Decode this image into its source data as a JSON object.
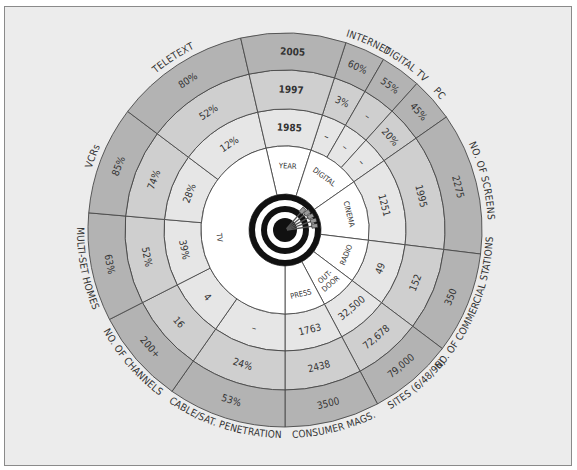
{
  "center": {
    "x": 285,
    "y": 230
  },
  "radii": {
    "bull": 36,
    "core": 84,
    "r1985": 121,
    "r1997": 160,
    "r2005": 197
  },
  "colors": {
    "background": "#ececec",
    "core": "#ffffff",
    "ring_1985": "#e6e6e6",
    "ring_1997": "#cfcfcf",
    "ring_2005": "#b3b3b3",
    "ink": "#333333",
    "bullseye": "#111111"
  },
  "year_header": {
    "label": "YEAR",
    "years": [
      "1985",
      "1997",
      "2005"
    ],
    "start": -13,
    "end": 18
  },
  "media": [
    {
      "name": "DIGITAL",
      "start": 18,
      "end": 55
    },
    {
      "name": "CINEMA",
      "start": 55,
      "end": 97
    },
    {
      "name": "RADIO",
      "start": 97,
      "end": 127
    },
    {
      "name": "OUT-DOOR",
      "start": 127,
      "end": 152
    },
    {
      "name": "PRESS",
      "start": 152,
      "end": 180
    },
    {
      "name": "TV",
      "start": 180,
      "end": 347
    }
  ],
  "segments": [
    {
      "id": "internet",
      "label": "INTERNET",
      "start": 18,
      "end": 30,
      "values": [
        "–",
        "3%",
        "60%"
      ]
    },
    {
      "id": "digital-tv",
      "label": "DIGITAL TV",
      "start": 30,
      "end": 42,
      "values": [
        "–",
        "–",
        "55%"
      ]
    },
    {
      "id": "pc",
      "label": "PC",
      "start": 42,
      "end": 55,
      "values": [
        "–",
        "20%",
        "45%"
      ]
    },
    {
      "id": "screens",
      "label": "NO. OF SCREENS",
      "start": 55,
      "end": 97,
      "values": [
        "1251",
        "1995",
        "2275"
      ]
    },
    {
      "id": "stations",
      "label": "NO. OF COMMERCIAL STATIONS",
      "start": 97,
      "end": 127,
      "values": [
        "49",
        "152",
        "350"
      ]
    },
    {
      "id": "sites",
      "label": "SITES (6/48/96)",
      "start": 127,
      "end": 152,
      "values": [
        "32,500",
        "72,678",
        "79,000"
      ]
    },
    {
      "id": "consumer-mags",
      "label": "CONSUMER MAGS.",
      "start": 152,
      "end": 180,
      "values": [
        "1763",
        "2438",
        "3500"
      ]
    },
    {
      "id": "cable-sat",
      "label": "CABLE/SAT. PENETRATION",
      "start": 180,
      "end": 215,
      "values": [
        "–",
        "24%",
        "53%"
      ]
    },
    {
      "id": "channels",
      "label": "NO. OF CHANNELS",
      "start": 215,
      "end": 243,
      "values": [
        "4",
        "16",
        "200+"
      ]
    },
    {
      "id": "multi-set",
      "label": "MULTI-SET HOMES",
      "start": 243,
      "end": 275,
      "values": [
        "39%",
        "52%",
        "63%"
      ]
    },
    {
      "id": "vcrs",
      "label": "VCRs",
      "start": 275,
      "end": 307,
      "values": [
        "28%",
        "74%",
        "85%"
      ]
    },
    {
      "id": "teletext",
      "label": "TELETEXT",
      "start": 307,
      "end": 347,
      "values": [
        "12%",
        "52%",
        "80%"
      ]
    }
  ]
}
